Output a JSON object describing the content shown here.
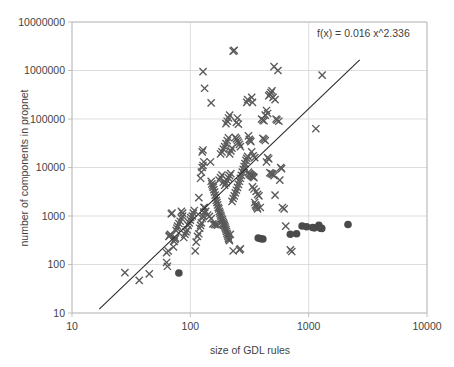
{
  "chart_data": {
    "type": "scatter",
    "title": "",
    "xlabel": "size of GDL rules",
    "ylabel": "number of components in propnet",
    "xscale": "log",
    "yscale": "log",
    "xlim": [
      10,
      10000
    ],
    "ylim": [
      10,
      10000000
    ],
    "xticks": [
      "10",
      "100",
      "1000",
      "10000"
    ],
    "xtick_values": [
      10,
      100,
      1000,
      10000
    ],
    "yticks": [
      "10",
      "100",
      "1000",
      "10000",
      "100000",
      "1000000",
      "10000000"
    ],
    "ytick_values": [
      10,
      100,
      1000,
      10000,
      100000,
      1000000,
      10000000
    ],
    "grid": true,
    "legend": "none",
    "annotations": [
      {
        "name": "fit-equation",
        "text": "f(x) = 0.016 x^2.336",
        "x_frac": 0.72,
        "y_frac": 0.05
      }
    ],
    "trendline": {
      "name": "power-fit-line",
      "equation": "f(x) = 0.016 x^2.336",
      "coefficient": 0.016,
      "exponent": 2.336,
      "x_start": 17,
      "x_end": 2700,
      "color": "#2b2b2b"
    },
    "series": [
      {
        "name": "propnet-size-crosses",
        "marker": "x",
        "color": "#595959",
        "points": [
          [
            28,
            68
          ],
          [
            37,
            47
          ],
          [
            45,
            64
          ],
          [
            63,
            110
          ],
          [
            64,
            92
          ],
          [
            63,
            175
          ],
          [
            65,
            190
          ],
          [
            66,
            380
          ],
          [
            67,
            400
          ],
          [
            68,
            420
          ],
          [
            69,
            1100
          ],
          [
            70,
            1150
          ],
          [
            72,
            230
          ],
          [
            73,
            300
          ],
          [
            74,
            330
          ],
          [
            75,
            350
          ],
          [
            76,
            500
          ],
          [
            77,
            560
          ],
          [
            78,
            620
          ],
          [
            80,
            700
          ],
          [
            82,
            780
          ],
          [
            84,
            900
          ],
          [
            86,
            1000
          ],
          [
            88,
            360
          ],
          [
            90,
            420
          ],
          [
            92,
            470
          ],
          [
            94,
            520
          ],
          [
            96,
            640
          ],
          [
            98,
            720
          ],
          [
            100,
            820
          ],
          [
            101,
            930
          ],
          [
            104,
            1000
          ],
          [
            106,
            1150
          ],
          [
            108,
            1300
          ],
          [
            110,
            190
          ],
          [
            112,
            290
          ],
          [
            115,
            380
          ],
          [
            118,
            430
          ],
          [
            120,
            560
          ],
          [
            122,
            640
          ],
          [
            124,
            720
          ],
          [
            126,
            900
          ],
          [
            128,
            1000
          ],
          [
            130,
            1200
          ],
          [
            132,
            1500
          ],
          [
            118,
            2400
          ],
          [
            122,
            6000
          ],
          [
            124,
            8000
          ],
          [
            126,
            10000
          ],
          [
            128,
            11000
          ],
          [
            126,
            21000
          ],
          [
            128,
            23000
          ],
          [
            130,
            13000
          ],
          [
            132,
            430000
          ],
          [
            128,
            950000
          ],
          [
            150,
            215000
          ],
          [
            148,
            13000
          ],
          [
            150,
            5200
          ],
          [
            152,
            4600
          ],
          [
            154,
            4200
          ],
          [
            156,
            3900
          ],
          [
            158,
            3500
          ],
          [
            160,
            3100
          ],
          [
            162,
            2700
          ],
          [
            164,
            2400
          ],
          [
            166,
            2100
          ],
          [
            168,
            1900
          ],
          [
            170,
            1700
          ],
          [
            172,
            1500
          ],
          [
            174,
            1400
          ],
          [
            176,
            1250
          ],
          [
            178,
            1150
          ],
          [
            180,
            1050
          ],
          [
            182,
            980
          ],
          [
            184,
            900
          ],
          [
            186,
            840
          ],
          [
            188,
            780
          ],
          [
            190,
            720
          ],
          [
            192,
            680
          ],
          [
            194,
            640
          ],
          [
            196,
            600
          ],
          [
            198,
            560
          ],
          [
            200,
            520
          ],
          [
            202,
            480
          ],
          [
            204,
            440
          ],
          [
            206,
            410
          ],
          [
            208,
            380
          ],
          [
            210,
            350
          ],
          [
            212,
            330
          ],
          [
            214,
            310
          ],
          [
            150,
            880
          ],
          [
            155,
            690
          ],
          [
            160,
            670
          ],
          [
            165,
            660
          ],
          [
            170,
            650
          ],
          [
            175,
            5500
          ],
          [
            180,
            6200
          ],
          [
            185,
            7000
          ],
          [
            190,
            5000
          ],
          [
            195,
            4300
          ],
          [
            200,
            4800
          ],
          [
            205,
            5400
          ],
          [
            210,
            6100
          ],
          [
            215,
            6800
          ],
          [
            220,
            7500
          ],
          [
            180,
            19000
          ],
          [
            185,
            21000
          ],
          [
            190,
            24000
          ],
          [
            195,
            27000
          ],
          [
            200,
            31000
          ],
          [
            205,
            36000
          ],
          [
            210,
            41000
          ],
          [
            215,
            19000
          ],
          [
            220,
            22000
          ],
          [
            225,
            25000
          ],
          [
            230,
            2500000
          ],
          [
            235,
            2600000
          ],
          [
            200,
            80000
          ],
          [
            205,
            90000
          ],
          [
            210,
            105000
          ],
          [
            215,
            120000
          ],
          [
            225,
            2000
          ],
          [
            230,
            2300
          ],
          [
            235,
            2600
          ],
          [
            240,
            3000
          ],
          [
            245,
            3400
          ],
          [
            250,
            3900
          ],
          [
            255,
            4500
          ],
          [
            260,
            5200
          ],
          [
            265,
            6000
          ],
          [
            270,
            6900
          ],
          [
            275,
            8000
          ],
          [
            280,
            9200
          ],
          [
            285,
            10500
          ],
          [
            290,
            12000
          ],
          [
            295,
            14000
          ],
          [
            260,
            200
          ],
          [
            265,
            210
          ],
          [
            230,
            190
          ],
          [
            218,
            420
          ],
          [
            300,
            220000
          ],
          [
            305,
            250000
          ],
          [
            310,
            45000
          ],
          [
            315,
            38000
          ],
          [
            320,
            36000
          ],
          [
            325,
            34000
          ],
          [
            330,
            280000
          ],
          [
            335,
            220000
          ],
          [
            300,
            15500
          ],
          [
            305,
            17000
          ],
          [
            310,
            8000
          ],
          [
            315,
            7500
          ],
          [
            320,
            7200
          ],
          [
            325,
            7000
          ],
          [
            330,
            6800
          ],
          [
            335,
            6600
          ],
          [
            340,
            6400
          ],
          [
            345,
            6200
          ],
          [
            350,
            1900
          ],
          [
            355,
            1700
          ],
          [
            360,
            1600
          ],
          [
            365,
            1500
          ],
          [
            370,
            1400
          ],
          [
            380,
            2600
          ],
          [
            390,
            1500
          ],
          [
            400,
            100000
          ],
          [
            410,
            95000
          ],
          [
            420,
            92000
          ],
          [
            430,
            120000
          ],
          [
            440,
            150000
          ],
          [
            450,
            130000
          ],
          [
            460,
            300000
          ],
          [
            470,
            320000
          ],
          [
            480,
            350000
          ],
          [
            490,
            380000
          ],
          [
            500,
            280000
          ],
          [
            510,
            1200000
          ],
          [
            520,
            250000
          ],
          [
            530,
            100000
          ],
          [
            540,
            95000
          ],
          [
            550,
            1000000
          ],
          [
            560,
            90000
          ],
          [
            570,
            5500
          ],
          [
            580,
            10000
          ],
          [
            590,
            9500
          ],
          [
            600,
            1500
          ],
          [
            620,
            1400
          ],
          [
            640,
            620
          ],
          [
            700,
            200
          ],
          [
            720,
            185
          ],
          [
            1150,
            63000
          ],
          [
            1300,
            800000
          ],
          [
            410,
            40000
          ],
          [
            420,
            38000
          ],
          [
            430,
            36000
          ],
          [
            440,
            13000
          ],
          [
            450,
            16000
          ],
          [
            460,
            15000
          ],
          [
            470,
            7800
          ],
          [
            480,
            7600
          ],
          [
            490,
            7400
          ],
          [
            500,
            7200
          ],
          [
            510,
            6800
          ],
          [
            520,
            2700
          ],
          [
            360,
            3200
          ],
          [
            370,
            2800
          ],
          [
            345,
            3600
          ],
          [
            335,
            4000
          ],
          [
            330,
            21000
          ],
          [
            340,
            17500
          ],
          [
            350,
            16000
          ],
          [
            250,
            105000
          ],
          [
            255,
            78000
          ],
          [
            245,
            85000
          ],
          [
            240,
            42000
          ],
          [
            245,
            39000
          ],
          [
            250,
            36000
          ],
          [
            255,
            33000
          ],
          [
            260,
            30000
          ],
          [
            265,
            27000
          ],
          [
            130,
            1500
          ],
          [
            135,
            1250
          ],
          [
            140,
            1050
          ],
          [
            145,
            980
          ],
          [
            84,
            1250
          ],
          [
            86,
            1150
          ]
        ]
      },
      {
        "name": "propnet-size-dots",
        "marker": "o",
        "color": "#4a4a4a",
        "points": [
          [
            80,
            67
          ],
          [
            375,
            350
          ],
          [
            395,
            340
          ],
          [
            410,
            335
          ],
          [
            700,
            420
          ],
          [
            790,
            430
          ],
          [
            880,
            620
          ],
          [
            960,
            600
          ],
          [
            1080,
            580
          ],
          [
            1120,
            570
          ],
          [
            1220,
            640
          ],
          [
            1260,
            560
          ],
          [
            1290,
            555
          ],
          [
            2150,
            670
          ]
        ]
      }
    ]
  },
  "axis_label_color": "#3f3f3f",
  "grid_color": "#d4d4d4",
  "frame_color": "#b9b9b9",
  "background": "#ffffff"
}
